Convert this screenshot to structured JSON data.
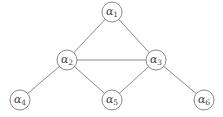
{
  "diagram": {
    "type": "graph",
    "style": {
      "edge_color": "#8a8a8a",
      "node_stroke": "#8a8a8a",
      "node_fill": "#ffffff",
      "label_color": "#444444",
      "node_radius": 10
    },
    "nodes": [
      {
        "id": "a1",
        "symbol": "α",
        "subscript": "1",
        "x": 112,
        "y": 12
      },
      {
        "id": "a2",
        "symbol": "α",
        "subscript": "2",
        "x": 67,
        "y": 60
      },
      {
        "id": "a3",
        "symbol": "α",
        "subscript": "3",
        "x": 156,
        "y": 60
      },
      {
        "id": "a4",
        "symbol": "α",
        "subscript": "4",
        "x": 20,
        "y": 100
      },
      {
        "id": "a5",
        "symbol": "α",
        "subscript": "5",
        "x": 112,
        "y": 100
      },
      {
        "id": "a6",
        "symbol": "α",
        "subscript": "6",
        "x": 204,
        "y": 100
      }
    ],
    "edges": [
      {
        "from": "a1",
        "to": "a2"
      },
      {
        "from": "a1",
        "to": "a3"
      },
      {
        "from": "a2",
        "to": "a3"
      },
      {
        "from": "a2",
        "to": "a4"
      },
      {
        "from": "a2",
        "to": "a5"
      },
      {
        "from": "a3",
        "to": "a5"
      },
      {
        "from": "a3",
        "to": "a6"
      }
    ]
  }
}
